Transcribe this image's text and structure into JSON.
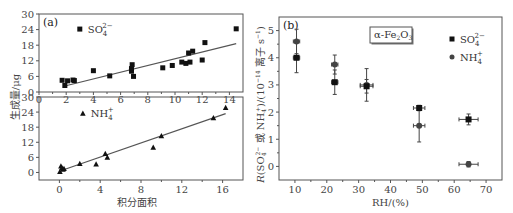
{
  "chart_data": [
    {
      "id": "a-top",
      "type": "scatter",
      "panel_label": "(a)",
      "legend": "SO4^2-",
      "legend_main": "SO",
      "legend_sub": "4",
      "legend_sup": "2−",
      "marker": "square",
      "xlim": [
        0,
        15
      ],
      "ylim": [
        0,
        30
      ],
      "xticks": [
        0,
        2,
        4,
        6,
        8,
        10,
        12,
        14
      ],
      "yticks": [
        0,
        6,
        12,
        18,
        24,
        30
      ],
      "points": [
        [
          1.7,
          4.5
        ],
        [
          1.9,
          2.5
        ],
        [
          2.1,
          4.3
        ],
        [
          2.5,
          4.6
        ],
        [
          2.6,
          4.4
        ],
        [
          4.0,
          8.2
        ],
        [
          5.2,
          6.2
        ],
        [
          6.8,
          9.0
        ],
        [
          6.8,
          8.0
        ],
        [
          6.85,
          10.5
        ],
        [
          6.95,
          6.0
        ],
        [
          9.1,
          9.3
        ],
        [
          9.8,
          10.2
        ],
        [
          10.5,
          11.5
        ],
        [
          10.8,
          11.0
        ],
        [
          11.0,
          15.0
        ],
        [
          11.1,
          11.5
        ],
        [
          11.3,
          15.7
        ],
        [
          12.0,
          12.3
        ],
        [
          12.2,
          19.0
        ],
        [
          14.5,
          24.3
        ]
      ],
      "fit_line": [
        [
          1.9,
          2.3
        ],
        [
          14.5,
          18.6
        ]
      ]
    },
    {
      "id": "a-bottom",
      "type": "scatter",
      "legend": "NH4+",
      "legend_main": "NH",
      "legend_sub": "4",
      "legend_sup": "+",
      "marker": "triangle",
      "xlim": [
        -2,
        18
      ],
      "ylim": [
        -3,
        30
      ],
      "xticks": [
        0,
        4,
        8,
        12,
        16
      ],
      "yticks": [
        0,
        6,
        12,
        18,
        24,
        30
      ],
      "xlabel": "积分面积",
      "points": [
        [
          0.05,
          0.3
        ],
        [
          0.15,
          2.5
        ],
        [
          0.25,
          1.8
        ],
        [
          0.35,
          1.2
        ],
        [
          0.45,
          1.5
        ],
        [
          2.0,
          3.5
        ],
        [
          3.6,
          3.3
        ],
        [
          4.5,
          7.5
        ],
        [
          4.7,
          6.0
        ],
        [
          9.2,
          10.0
        ],
        [
          10.0,
          14.5
        ],
        [
          15.1,
          21.7
        ],
        [
          16.3,
          25.8
        ]
      ],
      "fit_line": [
        [
          0.2,
          0.8
        ],
        [
          16.3,
          23.4
        ]
      ]
    },
    {
      "id": "b",
      "type": "scatter",
      "panel_label": "(b)",
      "title_box": "α-Fe2O3",
      "title_main": "α-Fe",
      "title_sub1": "2",
      "title_mid": "O",
      "title_sub2": "3",
      "xlim": [
        5,
        75
      ],
      "ylim": [
        -0.5,
        5.5
      ],
      "xticks": [
        10,
        20,
        30,
        40,
        50,
        60,
        70
      ],
      "yticks": [
        0,
        1,
        2,
        3,
        4,
        5
      ],
      "xlabel": "RH/(%)",
      "ylabel": "R(SO4^2- 或 NH4+)/(10^-14 离子 s^-1)",
      "series": [
        {
          "name": "SO4^2-",
          "legend_main": "SO",
          "legend_sub": "4",
          "legend_sup": "2−",
          "marker": "square",
          "points": [
            {
              "x": 10.5,
              "y": 4.0,
              "xerr": 1.0,
              "yerr": 0.55
            },
            {
              "x": 22.5,
              "y": 3.1,
              "xerr": 1.0,
              "yerr": 0.45
            },
            {
              "x": 32.5,
              "y": 2.95,
              "xerr": 2.0,
              "yerr": 0.25
            },
            {
              "x": 49.0,
              "y": 2.15,
              "xerr": 1.8,
              "yerr": 0.1
            },
            {
              "x": 64.5,
              "y": 1.73,
              "xerr": 3.0,
              "yerr": 0.2
            }
          ]
        },
        {
          "name": "NH4+",
          "legend_main": "NH",
          "legend_sub": "4",
          "legend_sup": "+",
          "marker": "circle",
          "points": [
            {
              "x": 10.5,
              "y": 4.6,
              "xerr": 1.0,
              "yerr": 0.45
            },
            {
              "x": 22.5,
              "y": 3.75,
              "xerr": 1.0,
              "yerr": 0.35
            },
            {
              "x": 32.5,
              "y": 3.0,
              "xerr": 2.0,
              "yerr": 0.6
            },
            {
              "x": 49.0,
              "y": 1.5,
              "xerr": 1.8,
              "yerr": 0.6
            },
            {
              "x": 64.5,
              "y": 0.08,
              "xerr": 3.0,
              "yerr": 0.1
            }
          ]
        }
      ]
    }
  ],
  "shared": {
    "ylabel_a": "生成量/μg"
  },
  "colors": {
    "marker": "#111111",
    "marker_gray": "#444444",
    "axis": "#555555",
    "text": "#444444"
  }
}
